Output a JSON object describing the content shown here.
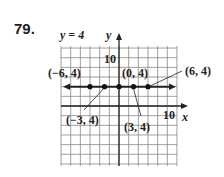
{
  "problem_number": "79.",
  "chart_data": {
    "type": "line",
    "title": "",
    "equation_label": "y = 4",
    "xlabel": "x",
    "ylabel": "y",
    "x_tick_label": "10",
    "y_tick_label": "10",
    "xlim": [
      -12,
      12
    ],
    "ylim": [
      -12,
      12
    ],
    "grid": true,
    "grid_step": 2,
    "series": [
      {
        "name": "y = 4",
        "x": [
          -6,
          -3,
          0,
          3,
          6
        ],
        "y": [
          4,
          4,
          4,
          4,
          4
        ]
      }
    ],
    "point_labels": [
      "(−6, 4)",
      "(−3, 4)",
      "(0, 4)",
      "(3, 4)",
      "(6, 4)"
    ]
  },
  "labels": {
    "eq": "y = 4",
    "x_axis": "x",
    "y_axis": "y",
    "x_tick": "10",
    "y_tick": "10",
    "p1": "(−6, 4)",
    "p2": "(−3, 4)",
    "p3": "(0, 4)",
    "p4": "(3, 4)",
    "p5": "(6, 4)"
  }
}
